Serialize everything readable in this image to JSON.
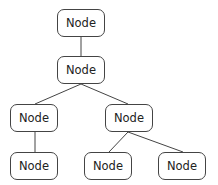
{
  "diagram": {
    "type": "tree",
    "nodes": [
      {
        "id": "n1",
        "label": "Node",
        "x": 57,
        "y": 9
      },
      {
        "id": "n2",
        "label": "Node",
        "x": 57,
        "y": 56
      },
      {
        "id": "n3",
        "label": "Node",
        "x": 10,
        "y": 104
      },
      {
        "id": "n4",
        "label": "Node",
        "x": 10,
        "y": 152
      },
      {
        "id": "n5",
        "label": "Node",
        "x": 105,
        "y": 104
      },
      {
        "id": "n6",
        "label": "Node",
        "x": 84,
        "y": 152
      },
      {
        "id": "n7",
        "label": "Node",
        "x": 158,
        "y": 152
      }
    ],
    "edges": [
      {
        "from": "n1",
        "to": "n2"
      },
      {
        "from": "n2",
        "to": "n3"
      },
      {
        "from": "n2",
        "to": "n5"
      },
      {
        "from": "n3",
        "to": "n4"
      },
      {
        "from": "n5",
        "to": "n6"
      },
      {
        "from": "n5",
        "to": "n7"
      }
    ],
    "colors": {
      "stroke": "#444444",
      "text": "#222222",
      "background": "#ffffff"
    }
  }
}
